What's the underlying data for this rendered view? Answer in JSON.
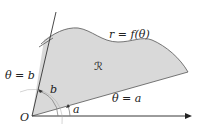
{
  "diagram": {
    "labels": {
      "curve": "r = f(θ)",
      "region": "ℛ",
      "ray_b": "θ = b",
      "ray_a": "θ = a",
      "angle_b": "b",
      "angle_a": "a",
      "origin": "O"
    },
    "colors": {
      "region_fill": "#d9d9d9",
      "stroke": "#555555",
      "axis": "#222222",
      "text": "#222222"
    }
  }
}
